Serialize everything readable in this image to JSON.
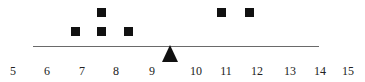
{
  "diagram": {
    "colors": {
      "weight": "#111111",
      "beam": "#6a6a6a",
      "label": "#222222"
    },
    "weights": [
      {
        "value": 7,
        "stack": 1
      },
      {
        "value": 7.8,
        "stack": 1
      },
      {
        "value": 7.8,
        "stack": 2
      },
      {
        "value": 8.6,
        "stack": 1
      },
      {
        "value": 11,
        "stack": 2
      },
      {
        "value": 11.8,
        "stack": 2
      }
    ],
    "fulcrum_position": 9.4,
    "tick_labels": [
      "5",
      "6",
      "7",
      "8",
      "9",
      "10",
      "11",
      "12",
      "13",
      "14",
      "15"
    ]
  }
}
